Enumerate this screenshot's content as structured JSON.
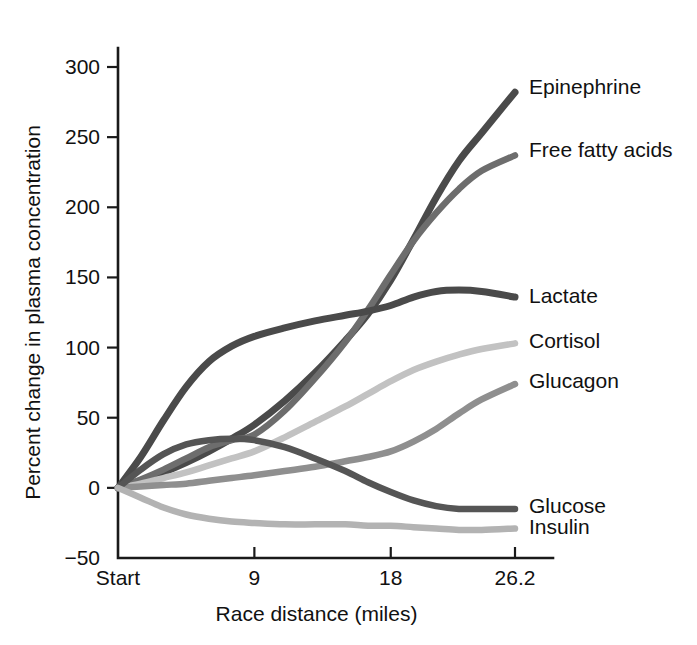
{
  "chart_data": {
    "type": "line",
    "title": "",
    "xlabel": "Race distance (miles)",
    "ylabel": "Percent change in plasma concentration",
    "xlim": [
      0,
      26.2
    ],
    "ylim": [
      -50,
      300
    ],
    "grid": false,
    "legend_position": "right-inline-labels",
    "x_tick_values": [
      0,
      9,
      18,
      26.2
    ],
    "x_tick_labels": [
      "Start",
      "9",
      "18",
      "26.2"
    ],
    "y_tick_values": [
      -50,
      0,
      50,
      100,
      150,
      200,
      250,
      300
    ],
    "y_tick_labels": [
      "−50",
      "0",
      "50",
      "100",
      "150",
      "200",
      "250",
      "300"
    ],
    "x": [
      0,
      1.5,
      3,
      4.5,
      6,
      7.5,
      9,
      11,
      13,
      15,
      16.5,
      18,
      19.5,
      21,
      22.5,
      24,
      26.2
    ],
    "series": [
      {
        "name": "Epinephrine",
        "label": "Epinephrine",
        "color": "#4a4a4a",
        "width": 7.0,
        "label_y_value": 285,
        "values": [
          0,
          5,
          11,
          18,
          26,
          35,
          45,
          62,
          82,
          105,
          124,
          148,
          177,
          207,
          233,
          253,
          282
        ]
      },
      {
        "name": "Free fatty acids",
        "label": "Free fatty acids",
        "color": "#6d6d6d",
        "width": 6.5,
        "label_y_value": 240,
        "values": [
          0,
          6,
          13,
          21,
          29,
          34,
          38,
          55,
          78,
          104,
          127,
          152,
          176,
          196,
          213,
          226,
          237
        ]
      },
      {
        "name": "Lactate",
        "label": "Lactate",
        "color": "#4a4a4a",
        "width": 7.0,
        "label_y_value": 136,
        "values": [
          0,
          22,
          48,
          72,
          90,
          101,
          108,
          114,
          119,
          123,
          126,
          130,
          136,
          140,
          141,
          140,
          136
        ]
      },
      {
        "name": "Cortisol",
        "label": "Cortisol",
        "color": "#c2c2c2",
        "width": 6.5,
        "label_y_value": 104,
        "values": [
          0,
          3,
          7,
          11,
          16,
          21,
          26,
          36,
          47,
          58,
          67,
          76,
          84,
          90,
          95,
          99,
          103
        ]
      },
      {
        "name": "Glucagon",
        "label": "Glucagon",
        "color": "#8f8f8f",
        "width": 6.5,
        "label_y_value": 75,
        "values": [
          0,
          1,
          2,
          3,
          5,
          7,
          9,
          12,
          15,
          19,
          22,
          26,
          33,
          42,
          53,
          63,
          74
        ]
      },
      {
        "name": "Glucose",
        "label": "Glucose",
        "color": "#555555",
        "width": 6.5,
        "label_y_value": -14,
        "values": [
          0,
          13,
          24,
          31,
          34,
          35,
          34,
          29,
          21,
          12,
          4,
          -3,
          -9,
          -13,
          -15,
          -15,
          -15
        ]
      },
      {
        "name": "Insulin",
        "label": "Insulin",
        "color": "#b3b3b3",
        "width": 6.5,
        "label_y_value": -29,
        "values": [
          0,
          -7,
          -14,
          -19,
          -22,
          -24,
          -25,
          -26,
          -26,
          -26,
          -27,
          -27,
          -28,
          -29,
          -30,
          -30,
          -29
        ]
      }
    ]
  }
}
